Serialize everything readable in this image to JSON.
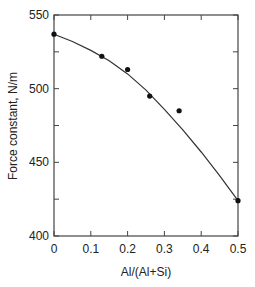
{
  "chart_data": {
    "type": "scatter",
    "title": "",
    "xlabel": "Al/(Al+Si)",
    "ylabel": "Force constant, N/m",
    "xlim": [
      0,
      0.5
    ],
    "ylim": [
      400,
      550
    ],
    "xticks": [
      0,
      0.1,
      0.2,
      0.3,
      0.4,
      0.5
    ],
    "xtick_labels": [
      "0",
      "0.1",
      "0.2",
      "0.3",
      "0.4",
      "0.5"
    ],
    "yticks": [
      400,
      450,
      500,
      550
    ],
    "ytick_labels": [
      "400",
      "450",
      "500",
      "550"
    ],
    "y_minor_ticks": [
      425,
      475,
      525
    ],
    "grid": false,
    "series": [
      {
        "name": "measured",
        "kind": "points",
        "x": [
          0,
          0.13,
          0.2,
          0.26,
          0.34,
          0.5
        ],
        "y": [
          537,
          522,
          513,
          495,
          485,
          424
        ]
      },
      {
        "name": "fit",
        "kind": "line",
        "x": [
          0,
          0.05,
          0.1,
          0.15,
          0.2,
          0.25,
          0.3,
          0.35,
          0.4,
          0.45,
          0.5
        ],
        "y": [
          537,
          532,
          526,
          519,
          510,
          499,
          486,
          472,
          457,
          441,
          424
        ]
      }
    ]
  }
}
